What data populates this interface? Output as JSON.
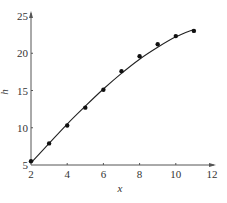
{
  "chart_data": {
    "type": "scatter",
    "title": "",
    "xlabel": "x",
    "ylabel": "h",
    "xlim": [
      2,
      12
    ],
    "ylim": [
      5,
      25
    ],
    "xticks": [
      2,
      4,
      6,
      8,
      10,
      12
    ],
    "yticks": [
      5,
      10,
      15,
      20,
      25
    ],
    "grid": false,
    "legend": null,
    "series": [
      {
        "name": "data points",
        "kind": "scatter",
        "x": [
          2,
          3,
          4,
          5,
          6,
          7,
          8,
          9,
          10,
          11
        ],
        "y": [
          5.5,
          7.9,
          10.3,
          12.7,
          15.1,
          17.6,
          19.6,
          21.2,
          22.3,
          23.0
        ]
      },
      {
        "name": "fitted curve",
        "kind": "line",
        "x": [
          2,
          3,
          4,
          5,
          6,
          7,
          8,
          9,
          10,
          11
        ],
        "y": [
          5.3,
          7.9,
          10.5,
          12.9,
          15.2,
          17.3,
          19.2,
          20.8,
          22.2,
          23.2
        ]
      }
    ],
    "colors": {
      "axis": "#555555",
      "points": "#111111",
      "curve": "#222222"
    }
  },
  "axes": {
    "x_label": "x",
    "y_label": "h",
    "x_tick_labels": [
      "2",
      "4",
      "6",
      "8",
      "10",
      "12"
    ],
    "y_tick_labels": [
      "5",
      "10",
      "15",
      "20",
      "25"
    ]
  }
}
